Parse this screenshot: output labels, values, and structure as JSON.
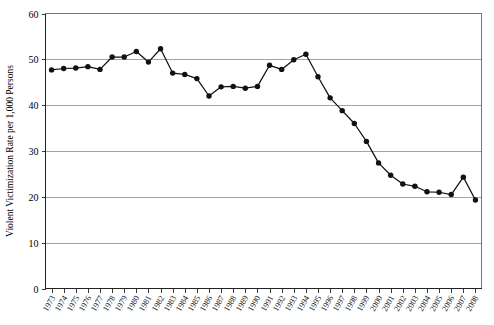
{
  "chart_data": {
    "type": "line",
    "title": "",
    "subtitle": "",
    "xlabel": "",
    "ylabel": "Violent Victimization Rate per 1,000 Persons",
    "ylim": [
      0,
      60
    ],
    "yticks": [
      0,
      10,
      20,
      30,
      40,
      50,
      60
    ],
    "ytick_labels": [
      "0",
      "10",
      "20",
      "30",
      "40",
      "50",
      "60"
    ],
    "grid": true,
    "grid_axis": "y",
    "legend": false,
    "legend_position": "none",
    "marker": "filled-circle",
    "line_color": "#111111",
    "marker_color": "#111111",
    "grid_color": "#999999",
    "categories": [
      "1973",
      "1974",
      "1975",
      "1976",
      "1977",
      "1978",
      "1979",
      "1980",
      "1981",
      "1982",
      "1983",
      "1984",
      "1985",
      "1986",
      "1987",
      "1988",
      "1989",
      "1990",
      "1991",
      "1992",
      "1993",
      "1994",
      "1995",
      "1996",
      "1997",
      "1998",
      "1999",
      "2000",
      "2001",
      "2002",
      "2003",
      "2004",
      "2005",
      "2006",
      "2007",
      "2008"
    ],
    "x": [
      1973,
      1974,
      1975,
      1976,
      1977,
      1978,
      1979,
      1980,
      1981,
      1982,
      1983,
      1984,
      1985,
      1986,
      1987,
      1988,
      1989,
      1990,
      1991,
      1992,
      1993,
      1994,
      1995,
      1996,
      1997,
      1998,
      1999,
      2000,
      2001,
      2002,
      2003,
      2004,
      2005,
      2006,
      2007,
      2008
    ],
    "values": [
      47.7,
      48.0,
      48.1,
      48.4,
      47.8,
      50.5,
      50.5,
      51.7,
      49.4,
      52.3,
      47.0,
      46.7,
      45.8,
      42.0,
      44.0,
      44.1,
      43.7,
      44.1,
      48.7,
      47.8,
      49.9,
      51.1,
      46.2,
      41.6,
      38.8,
      36.0,
      32.1,
      27.4,
      24.7,
      22.8,
      22.3,
      21.1,
      21.0,
      20.5,
      24.3,
      19.3
    ],
    "series": [
      {
        "name": "Violent victimization rate",
        "values": [
          47.7,
          48.0,
          48.1,
          48.4,
          47.8,
          50.5,
          50.5,
          51.7,
          49.4,
          52.3,
          47.0,
          46.7,
          45.8,
          42.0,
          44.0,
          44.1,
          43.7,
          44.1,
          48.7,
          47.8,
          49.9,
          51.1,
          46.2,
          41.6,
          38.8,
          36.0,
          32.1,
          27.4,
          24.7,
          22.8,
          22.3,
          21.1,
          21.0,
          20.5,
          24.3,
          19.3
        ]
      }
    ],
    "annotations": []
  }
}
